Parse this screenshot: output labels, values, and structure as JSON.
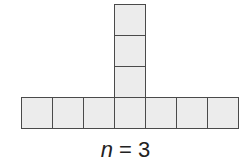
{
  "figure": {
    "label": {
      "variable": "n",
      "operator": " = ",
      "value": "3"
    },
    "colors": {
      "square_fill": "#ececec",
      "square_border": "#4a4a4a",
      "background": "#ffffff"
    },
    "row": {
      "count": 7,
      "left": 21,
      "top": 97,
      "cell_size": 31
    },
    "column": {
      "count": 3,
      "left": 114,
      "top": 4,
      "cell_size": 31
    }
  }
}
